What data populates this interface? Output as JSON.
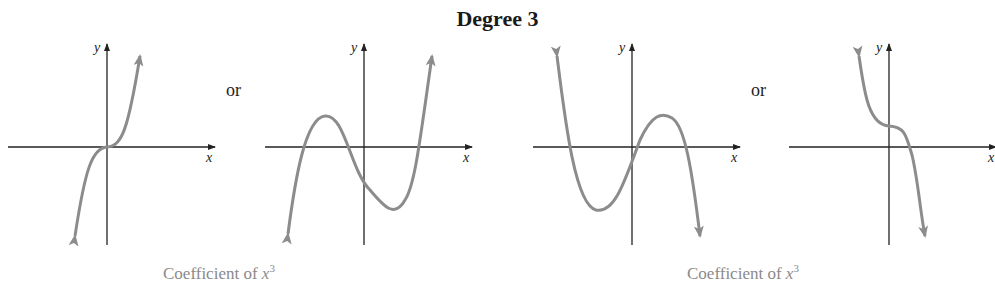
{
  "title": "Degree 3",
  "connectors": [
    "or",
    "or"
  ],
  "captions": [
    {
      "text": "Coefficient of ",
      "var": "x",
      "exp": "3"
    },
    {
      "text": "Coefficient of ",
      "var": "x",
      "exp": "3"
    }
  ],
  "axes": {
    "x_label": "x",
    "y_label": "y"
  },
  "colors": {
    "axis": "#222222",
    "curve": "#8c8c8c",
    "caption": "#8a8a8a"
  },
  "graphs": [
    {
      "id": "cubic-increasing-flat",
      "description": "Increasing cubic with inflection at origin, arrows down-left and up-right"
    },
    {
      "id": "cubic-increasing-turning",
      "description": "Increasing cubic with local max left of y-axis and local min right of y-axis, three x-intercepts"
    },
    {
      "id": "cubic-decreasing-turning",
      "description": "Decreasing cubic with local min left of y-axis and local max right of y-axis, three x-intercepts"
    },
    {
      "id": "cubic-decreasing-flat",
      "description": "Decreasing cubic with inflection above origin on y-axis, one x-intercept"
    }
  ]
}
